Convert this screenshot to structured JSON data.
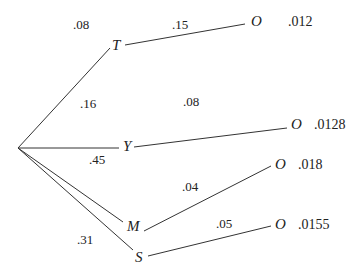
{
  "diagram": {
    "type": "probability-tree",
    "root": {
      "x": 18,
      "y": 148
    },
    "branches": [
      {
        "node": "T",
        "node_pos": [
          112,
          38
        ],
        "first_prob": ".08",
        "first_prob_pos": [
          73,
          18
        ],
        "second_prob": ".15",
        "second_prob_pos": [
          172,
          18
        ],
        "outcome": "O",
        "outcome_pos": [
          251,
          14
        ],
        "result": ".012",
        "result_pos": [
          288,
          15
        ],
        "line1": [
          18,
          148,
          110,
          48
        ],
        "line2": [
          125,
          45,
          245,
          24
        ]
      },
      {
        "node": "Y",
        "node_pos": [
          123,
          139
        ],
        "first_prob": ".16",
        "first_prob_pos": [
          80,
          97
        ],
        "second_prob": ".08",
        "second_prob_pos": [
          183,
          95
        ],
        "outcome": "O",
        "outcome_pos": [
          291,
          117
        ],
        "result": ".0128",
        "result_pos": [
          314,
          118
        ],
        "line1": [
          18,
          148,
          119,
          148
        ],
        "line2": [
          134,
          147,
          287,
          128
        ]
      },
      {
        "node": "M",
        "node_pos": [
          127,
          219
        ],
        "first_prob": ".45",
        "first_prob_pos": [
          89,
          153
        ],
        "second_prob": ".04",
        "second_prob_pos": [
          182,
          180
        ],
        "outcome": "O",
        "outcome_pos": [
          275,
          157
        ],
        "result": ".018",
        "result_pos": [
          298,
          158
        ],
        "line1": [
          18,
          148,
          123,
          222
        ],
        "line2": [
          144,
          231,
          271,
          166
        ]
      },
      {
        "node": "S",
        "node_pos": [
          135,
          250
        ],
        "first_prob": ".31",
        "first_prob_pos": [
          77,
          233
        ],
        "second_prob": ".05",
        "second_prob_pos": [
          216,
          217
        ],
        "outcome": "O",
        "outcome_pos": [
          275,
          217
        ],
        "result": ".0155",
        "result_pos": [
          298,
          218
        ],
        "line1": [
          18,
          148,
          133,
          250
        ],
        "line2": [
          148,
          256,
          271,
          226
        ]
      }
    ]
  }
}
